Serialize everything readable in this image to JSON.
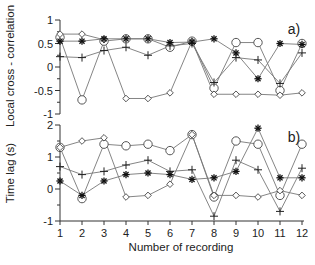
{
  "chart_data": [
    {
      "type": "line",
      "panel_label": "a)",
      "ylabel": "Local cross - correlation",
      "xlabel": "",
      "ylim": [
        -1,
        1
      ],
      "yticks": [
        1,
        0.5,
        0,
        -0.5,
        -1
      ],
      "ytick_labels": [
        "1",
        "0.5",
        "0",
        "-0.5",
        "-1"
      ],
      "x": [
        1,
        2,
        3,
        4,
        5,
        6,
        7,
        8,
        9,
        10,
        11,
        12
      ],
      "grid": false,
      "series": [
        {
          "name": "circle",
          "marker": "circle",
          "values": [
            0.63,
            -0.7,
            0.55,
            0.6,
            0.6,
            0.42,
            0.55,
            -0.45,
            0.52,
            0.52,
            -0.5,
            0.5
          ]
        },
        {
          "name": "diamond",
          "marker": "diamond",
          "values": [
            0.7,
            0.7,
            0.58,
            -0.67,
            -0.67,
            -0.55,
            0.55,
            -0.58,
            -0.58,
            -0.58,
            -0.6,
            -0.55
          ]
        },
        {
          "name": "plus",
          "marker": "plus",
          "values": [
            0.22,
            0.2,
            0.35,
            0.42,
            0.25,
            0.45,
            0.5,
            -0.33,
            0.2,
            0.15,
            -0.35,
            0.3
          ]
        },
        {
          "name": "asterisk",
          "marker": "asterisk",
          "values": [
            0.55,
            0.55,
            0.6,
            0.6,
            0.6,
            0.52,
            0.53,
            0.6,
            0.3,
            -0.25,
            0.5,
            0.48
          ]
        }
      ]
    },
    {
      "type": "line",
      "panel_label": "b)",
      "ylabel": "Time lag (s)",
      "xlabel": "Number of recording",
      "ylim": [
        -1,
        2
      ],
      "yticks": [
        2,
        1,
        0,
        -1
      ],
      "ytick_labels": [
        "2",
        "1",
        "0",
        "-1"
      ],
      "x": [
        1,
        2,
        3,
        4,
        5,
        6,
        7,
        8,
        9,
        10,
        11,
        12
      ],
      "xtick_labels": [
        "1",
        "2",
        "3",
        "4",
        "5",
        "6",
        "7",
        "8",
        "9",
        "10",
        "11",
        "12"
      ],
      "grid": false,
      "series": [
        {
          "name": "circle",
          "marker": "circle",
          "values": [
            1.3,
            -0.3,
            1.4,
            1.35,
            1.4,
            1.2,
            1.7,
            -0.25,
            1.5,
            1.4,
            -0.2,
            1.4
          ]
        },
        {
          "name": "diamond",
          "marker": "diamond",
          "values": [
            1.3,
            1.5,
            1.6,
            -0.25,
            -0.2,
            0.15,
            1.7,
            -0.2,
            -0.2,
            -0.25,
            -0.05,
            -0.2
          ]
        },
        {
          "name": "plus",
          "marker": "plus",
          "values": [
            0.7,
            0.45,
            0.55,
            0.75,
            0.9,
            0.55,
            0.6,
            -0.85,
            0.9,
            0.6,
            -0.7,
            0.65
          ]
        },
        {
          "name": "asterisk",
          "marker": "asterisk",
          "values": [
            0.25,
            -0.2,
            0.25,
            0.45,
            0.5,
            0.45,
            0.3,
            0.35,
            0.55,
            1.9,
            0.35,
            0.35
          ]
        }
      ]
    }
  ],
  "labels": {
    "top_ylabel": "Local cross - correlation",
    "bottom_ylabel": "Time lag (s)",
    "xlabel": "Number of recording",
    "panel_a": "a)",
    "panel_b": "b)"
  }
}
